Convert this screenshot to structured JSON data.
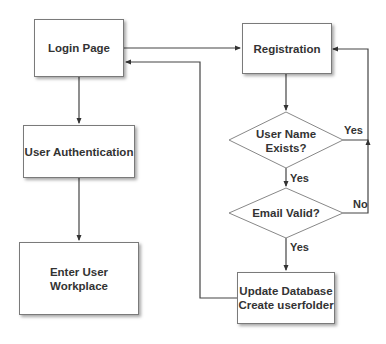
{
  "diagram": {
    "type": "flowchart",
    "nodes": {
      "login": {
        "label": "Login Page",
        "shape": "rectangle"
      },
      "registration": {
        "label": "Registration",
        "shape": "rectangle"
      },
      "auth": {
        "label": "User Authentication",
        "shape": "rectangle"
      },
      "workplace": {
        "label": "Enter User Workplace",
        "line1": "Enter User",
        "line2": "Workplace",
        "shape": "rectangle"
      },
      "username_exists": {
        "label": "User Name Exists?",
        "line1": "User Name",
        "line2": "Exists?",
        "shape": "diamond"
      },
      "email_valid": {
        "label": "Email Valid?",
        "shape": "diamond"
      },
      "update_db": {
        "label": "Update Database Create userfolder",
        "line1": "Update Database",
        "line2": "Create userfolder",
        "shape": "rectangle"
      }
    },
    "edges": [
      {
        "from": "login",
        "to": "registration",
        "label": ""
      },
      {
        "from": "login",
        "to": "auth",
        "label": ""
      },
      {
        "from": "auth",
        "to": "workplace",
        "label": ""
      },
      {
        "from": "registration",
        "to": "username_exists",
        "label": ""
      },
      {
        "from": "username_exists",
        "to": "registration",
        "label": "Yes"
      },
      {
        "from": "username_exists",
        "to": "email_valid",
        "label": "Yes"
      },
      {
        "from": "email_valid",
        "to": "registration",
        "label": "No"
      },
      {
        "from": "email_valid",
        "to": "update_db",
        "label": "Yes"
      },
      {
        "from": "update_db",
        "to": "login",
        "label": ""
      }
    ],
    "edge_labels": {
      "exists_yes_right": "Yes",
      "exists_yes_down": "Yes",
      "email_no": "No",
      "email_yes": "Yes"
    }
  }
}
